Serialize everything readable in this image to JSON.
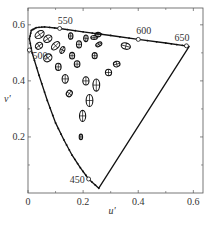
{
  "chart_data": {
    "type": "scatter",
    "title": "",
    "xlabel": "u'",
    "ylabel": "v'",
    "xlim": [
      0,
      0.635
    ],
    "ylim": [
      0,
      0.66
    ],
    "grid": false,
    "x_ticks": [
      0,
      0.2,
      0.4,
      0.6
    ],
    "x_tick_labels": [
      "0",
      "0.2",
      "0.4",
      "0.6"
    ],
    "x_minor_ticks": [
      0.1,
      0.3,
      0.5
    ],
    "y_ticks": [
      0.2,
      0.4,
      0.6
    ],
    "y_tick_labels": [
      "0.2",
      "0.4",
      "0.6"
    ],
    "y_minor_ticks": [
      0.1,
      0.3,
      0.5
    ],
    "spectral_locus": {
      "points": [
        [
          0.257,
          0.017
        ],
        [
          0.22,
          0.05
        ],
        [
          0.19,
          0.09
        ],
        [
          0.16,
          0.135
        ],
        [
          0.13,
          0.19
        ],
        [
          0.1,
          0.25
        ],
        [
          0.07,
          0.33
        ],
        [
          0.04,
          0.42
        ],
        [
          0.015,
          0.5
        ],
        [
          0.005,
          0.55
        ],
        [
          0.012,
          0.58
        ],
        [
          0.03,
          0.59
        ],
        [
          0.06,
          0.593
        ],
        [
          0.115,
          0.587
        ],
        [
          0.2,
          0.575
        ],
        [
          0.3,
          0.562
        ],
        [
          0.4,
          0.548
        ],
        [
          0.5,
          0.535
        ],
        [
          0.56,
          0.527
        ],
        [
          0.585,
          0.523
        ],
        [
          0.257,
          0.017
        ]
      ],
      "wavelength_markers": [
        {
          "label": "450",
          "u": 0.22,
          "v": 0.05
        },
        {
          "label": "500",
          "u": 0.005,
          "v": 0.51
        },
        {
          "label": "550",
          "u": 0.115,
          "v": 0.587
        },
        {
          "label": "600",
          "u": 0.4,
          "v": 0.548
        },
        {
          "label": "650",
          "u": 0.575,
          "v": 0.525
        }
      ]
    },
    "ellipses": [
      {
        "u": 0.042,
        "v": 0.565,
        "rx": 0.018,
        "ry": 0.012,
        "angle": -35
      },
      {
        "u": 0.072,
        "v": 0.55,
        "rx": 0.016,
        "ry": 0.012,
        "angle": -35
      },
      {
        "u": 0.04,
        "v": 0.525,
        "rx": 0.014,
        "ry": 0.011,
        "angle": -35
      },
      {
        "u": 0.1,
        "v": 0.525,
        "rx": 0.018,
        "ry": 0.011,
        "angle": -45
      },
      {
        "u": 0.125,
        "v": 0.51,
        "rx": 0.013,
        "ry": 0.008,
        "angle": -65
      },
      {
        "u": 0.072,
        "v": 0.482,
        "rx": 0.016,
        "ry": 0.013,
        "angle": -40
      },
      {
        "u": 0.155,
        "v": 0.56,
        "rx": 0.012,
        "ry": 0.008,
        "angle": -90
      },
      {
        "u": 0.185,
        "v": 0.53,
        "rx": 0.013,
        "ry": 0.009,
        "angle": -90
      },
      {
        "u": 0.16,
        "v": 0.49,
        "rx": 0.012,
        "ry": 0.009,
        "angle": -90
      },
      {
        "u": 0.178,
        "v": 0.46,
        "rx": 0.012,
        "ry": 0.01,
        "angle": -90
      },
      {
        "u": 0.21,
        "v": 0.552,
        "rx": 0.012,
        "ry": 0.008,
        "angle": -85
      },
      {
        "u": 0.254,
        "v": 0.565,
        "rx": 0.011,
        "ry": 0.008,
        "angle": 0
      },
      {
        "u": 0.257,
        "v": 0.53,
        "rx": 0.012,
        "ry": 0.007,
        "angle": -30
      },
      {
        "u": 0.242,
        "v": 0.49,
        "rx": 0.011,
        "ry": 0.009,
        "angle": -90
      },
      {
        "u": 0.24,
        "v": 0.555,
        "rx": 0.012,
        "ry": 0.007,
        "angle": 0
      },
      {
        "u": 0.355,
        "v": 0.524,
        "rx": 0.017,
        "ry": 0.011,
        "angle": 15
      },
      {
        "u": 0.322,
        "v": 0.46,
        "rx": 0.012,
        "ry": 0.01,
        "angle": -15
      },
      {
        "u": 0.292,
        "v": 0.43,
        "rx": 0.012,
        "ry": 0.011,
        "angle": -90
      },
      {
        "u": 0.135,
        "v": 0.407,
        "rx": 0.016,
        "ry": 0.011,
        "angle": -90
      },
      {
        "u": 0.21,
        "v": 0.4,
        "rx": 0.015,
        "ry": 0.011,
        "angle": -90
      },
      {
        "u": 0.15,
        "v": 0.355,
        "rx": 0.012,
        "ry": 0.01,
        "angle": -55
      },
      {
        "u": 0.248,
        "v": 0.385,
        "rx": 0.022,
        "ry": 0.012,
        "angle": -90
      },
      {
        "u": 0.223,
        "v": 0.33,
        "rx": 0.022,
        "ry": 0.012,
        "angle": -90
      },
      {
        "u": 0.198,
        "v": 0.275,
        "rx": 0.02,
        "ry": 0.011,
        "angle": -90
      },
      {
        "u": 0.192,
        "v": 0.2,
        "rx": 0.01,
        "ry": 0.006,
        "angle": -90
      },
      {
        "u": 0.11,
        "v": 0.45,
        "rx": 0.013,
        "ry": 0.01,
        "angle": -90
      }
    ]
  },
  "axes": {
    "xlabel": "u'",
    "ylabel": "v'"
  }
}
